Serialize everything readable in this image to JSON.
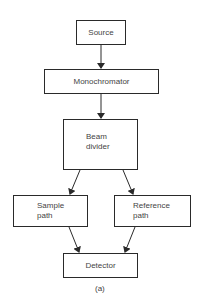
{
  "diagram": {
    "type": "flowchart",
    "nodes": [
      {
        "id": "source",
        "label": "Source"
      },
      {
        "id": "monochromator",
        "label": "Monochromator"
      },
      {
        "id": "beam_divider",
        "label_line1": "Beam",
        "label_line2": "divider"
      },
      {
        "id": "sample_path",
        "label_line1": "Sample",
        "label_line2": "path"
      },
      {
        "id": "reference_path",
        "label_line1": "Reference",
        "label_line2": "path"
      },
      {
        "id": "detector",
        "label": "Detector"
      }
    ],
    "edges": [
      {
        "from": "source",
        "to": "monochromator"
      },
      {
        "from": "monochromator",
        "to": "beam_divider"
      },
      {
        "from": "beam_divider",
        "to": "sample_path"
      },
      {
        "from": "beam_divider",
        "to": "reference_path"
      },
      {
        "from": "sample_path",
        "to": "detector"
      },
      {
        "from": "reference_path",
        "to": "detector"
      }
    ],
    "caption": "(a)",
    "colors": {
      "stroke": "#2a2a2a",
      "text": "#444444",
      "background": "#ffffff"
    }
  }
}
